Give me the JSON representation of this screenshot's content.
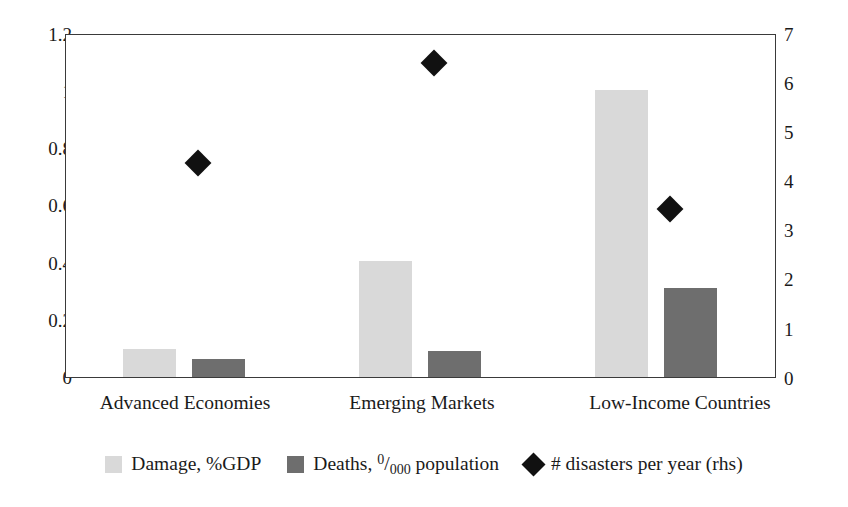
{
  "chart_data": {
    "type": "bar",
    "title": "",
    "subtitle": "",
    "xlabel": "",
    "ylabel": "",
    "categories": [
      "Advanced Economies",
      "Emerging Markets",
      "Low-Income Countries"
    ],
    "series": [
      {
        "name": "Damage, %GDP",
        "type": "bar",
        "axis": "left",
        "color": "#d9d9d9",
        "values": [
          0.1,
          0.41,
          1.01
        ]
      },
      {
        "name": "Deaths, 0/000 population",
        "type": "bar",
        "axis": "left",
        "color": "#6e6e6e",
        "values": [
          0.065,
          0.09,
          0.315
        ]
      },
      {
        "name": "# disasters per year (rhs)",
        "type": "scatter",
        "axis": "right",
        "color": "#111111",
        "marker": "diamond",
        "values": [
          4.4,
          6.45,
          3.45
        ]
      }
    ],
    "left_axis": {
      "ylim": [
        0,
        1.2
      ],
      "ticks": [
        0,
        0.2,
        0.4,
        0.6,
        0.8,
        1,
        1.2
      ],
      "ticklabels": [
        "0",
        "0.2",
        "0.4",
        "0.6",
        "0.8",
        "1",
        "1.2"
      ]
    },
    "right_axis": {
      "ylim": [
        0,
        7
      ],
      "ticks": [
        0,
        1,
        2,
        3,
        4,
        5,
        6,
        7
      ],
      "ticklabels": [
        "0",
        "1",
        "2",
        "3",
        "4",
        "5",
        "6",
        "7"
      ]
    },
    "grid": false,
    "legend_position": "bottom-center"
  },
  "legend": {
    "entries": [
      {
        "label": "Damage, %GDP",
        "marker": "square-light"
      },
      {
        "label_prefix": "Deaths, ",
        "label_numerator": "0",
        "label_denominator": "000",
        "label_suffix": " population",
        "marker": "square-dark"
      },
      {
        "label": "# disasters per year (rhs)",
        "marker": "diamond"
      }
    ]
  },
  "axes": {
    "left_ticklabels": [
      "1.2",
      "1",
      "0.8",
      "0.6",
      "0.4",
      "0.2",
      "0"
    ],
    "right_ticklabels": [
      "7",
      "6",
      "5",
      "4",
      "3",
      "2",
      "1",
      "0"
    ]
  },
  "categories": [
    "Advanced Economies",
    "Emerging Markets",
    "Low-Income Countries"
  ]
}
